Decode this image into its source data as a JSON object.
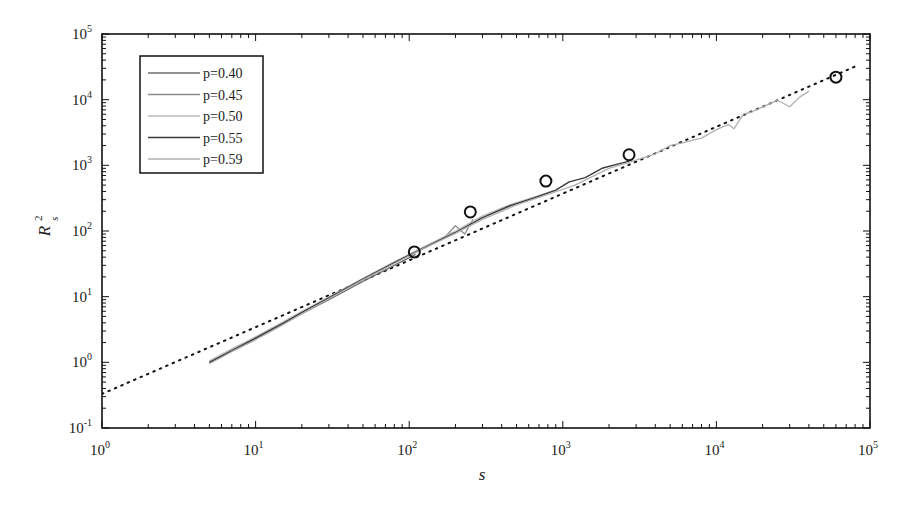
{
  "chart_data": {
    "type": "line",
    "title": "",
    "xlabel": "s",
    "ylabel": "R_s^2",
    "xscale": "log",
    "yscale": "log",
    "xlim": [
      1,
      100000
    ],
    "ylim": [
      0.1,
      100000
    ],
    "x_tick_labels": [
      "10^0",
      "10^1",
      "10^2",
      "10^3",
      "10^4",
      "10^5"
    ],
    "y_tick_labels": [
      "10^-1",
      "10^0",
      "10^1",
      "10^2",
      "10^3",
      "10^4",
      "10^5"
    ],
    "grid": false,
    "legend_position": "upper-left",
    "series": [
      {
        "name": "p=0.40",
        "color": "#6e6e6e",
        "width": 1.3,
        "x": [
          5,
          7,
          10,
          15,
          20,
          30,
          50,
          80,
          110
        ],
        "y": [
          1.0,
          1.5,
          2.3,
          3.8,
          5.5,
          9,
          17,
          30,
          44
        ]
      },
      {
        "name": "p=0.45",
        "color": "#8a8a8a",
        "width": 1.3,
        "x": [
          5,
          7,
          10,
          15,
          20,
          30,
          50,
          80,
          120,
          170,
          200,
          230,
          260
        ],
        "y": [
          1.0,
          1.55,
          2.4,
          4.0,
          5.8,
          9.5,
          18,
          33,
          52,
          80,
          120,
          90,
          150
        ]
      },
      {
        "name": "p=0.50",
        "color": "#bdbdbd",
        "width": 1.3,
        "x": [
          5,
          7,
          10,
          15,
          20,
          30,
          50,
          80,
          120,
          200,
          300,
          450,
          650,
          900
        ],
        "y": [
          1.05,
          1.6,
          2.45,
          4.1,
          6,
          10,
          19,
          34,
          55,
          100,
          170,
          250,
          330,
          420
        ]
      },
      {
        "name": "p=0.55",
        "color": "#3a3a3a",
        "width": 1.4,
        "x": [
          5,
          7,
          10,
          15,
          20,
          30,
          50,
          80,
          120,
          200,
          300,
          450,
          650,
          900,
          1100,
          1400,
          1800,
          2300,
          2700
        ],
        "y": [
          1.0,
          1.5,
          2.35,
          3.9,
          5.7,
          9.6,
          18.5,
          33,
          53,
          95,
          160,
          240,
          320,
          420,
          560,
          650,
          900,
          1050,
          1150
        ]
      },
      {
        "name": "p=0.59",
        "color": "#b0b0b0",
        "width": 1.3,
        "x": [
          5,
          7,
          10,
          15,
          20,
          30,
          50,
          80,
          120,
          200,
          300,
          500,
          800,
          1200,
          2000,
          3000,
          4000,
          5000,
          6000,
          8000,
          10000,
          12000,
          13000,
          15000,
          17000,
          20000,
          25000,
          30000,
          35000,
          40000
        ],
        "y": [
          0.95,
          1.45,
          2.2,
          3.7,
          5.5,
          9.3,
          18,
          32,
          52,
          92,
          150,
          250,
          360,
          500,
          900,
          1200,
          1500,
          2000,
          2200,
          2600,
          3500,
          4200,
          3600,
          6000,
          6500,
          7800,
          9800,
          7800,
          11000,
          13500
        ]
      }
    ],
    "reference_line": {
      "name": "fit",
      "style": "dotted",
      "color": "#111111",
      "x": [
        1,
        80000
      ],
      "y": [
        0.33,
        32000
      ]
    },
    "markers": {
      "style": "open-circle",
      "color": "#111111",
      "x": [
        108,
        250,
        776,
        2700,
        60000
      ],
      "y": [
        48,
        195,
        575,
        1450,
        22000
      ]
    }
  },
  "legend": {
    "items": [
      {
        "label": "p=0.40"
      },
      {
        "label": "p=0.45"
      },
      {
        "label": "p=0.50"
      },
      {
        "label": "p=0.55"
      },
      {
        "label": "p=0.59"
      }
    ]
  }
}
